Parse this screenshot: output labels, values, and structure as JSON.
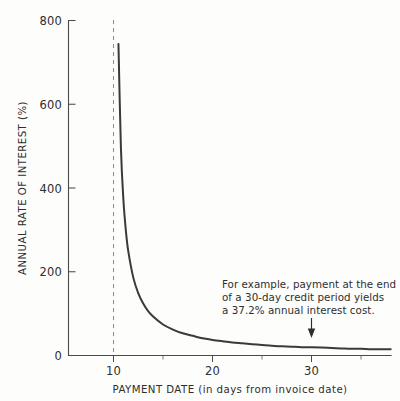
{
  "chart_data": {
    "type": "line",
    "title": "",
    "xlabel": "PAYMENT DATE (in days from invoice date)",
    "ylabel": "ANNUAL RATE OF INTEREST (%)",
    "xlim": [
      5,
      38
    ],
    "ylim": [
      0,
      800
    ],
    "grid": false,
    "legend": null,
    "x_ticks": [
      10,
      20,
      30
    ],
    "x_tick_labels": [
      "10",
      "20",
      "30"
    ],
    "x_minor_ticks": [
      15,
      25,
      35
    ],
    "y_ticks": [
      0,
      200,
      400,
      600,
      800
    ],
    "y_tick_labels": [
      "0",
      "200",
      "400",
      "600",
      "800"
    ],
    "series": [
      {
        "name": "Annual rate of interest",
        "x": [
          10.5,
          10.75,
          11,
          11.25,
          11.5,
          12,
          12.5,
          13,
          13.5,
          14,
          15,
          16,
          17,
          18,
          19,
          20,
          21,
          22,
          23,
          24,
          25,
          26,
          27,
          28,
          29,
          30,
          31,
          32,
          33,
          34,
          35,
          36,
          37,
          38
        ],
        "y": [
          744,
          496,
          372,
          298,
          248,
          186,
          149,
          124,
          106,
          93,
          74,
          62,
          53,
          47,
          41,
          37.2,
          34,
          31,
          29,
          27,
          25,
          23,
          22,
          21,
          20,
          19.6,
          19,
          18,
          17,
          16,
          16,
          15,
          15,
          15
        ]
      }
    ],
    "reference_line": {
      "x": 10,
      "style": "dashed",
      "label": ""
    },
    "annotation": {
      "lines": [
        "For example, payment at the end",
        "of a 30-day credit period yields",
        "a 37.2% annual interest cost."
      ],
      "points_to_x": 30,
      "points_to_y": 37.2
    }
  },
  "axes": {
    "y_title": "ANNUAL RATE OF INTEREST (%)",
    "x_title": "PAYMENT DATE (in days from invoice date)",
    "y_labels": [
      "800",
      "600",
      "400",
      "200",
      "0"
    ],
    "x_labels": [
      "10",
      "20",
      "30"
    ]
  },
  "annotation": {
    "line1": "For example, payment at the end",
    "line2": "of a 30-day credit period yields",
    "line3": "a 37.2% annual interest cost."
  },
  "colors": {
    "background": "#fdfdfc",
    "curve": "#3a3a3a",
    "axis": "#4a4a4a",
    "dashed_reference": "#8d8d8d",
    "text": "#2e2e2e"
  }
}
